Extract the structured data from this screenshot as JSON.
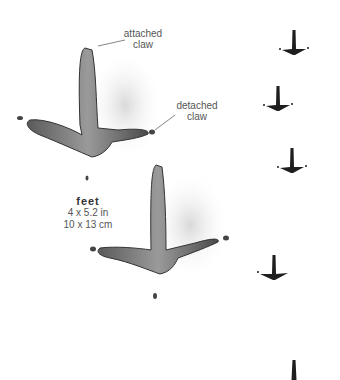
{
  "diagram": {
    "annotations": {
      "attached_claw": [
        "attached",
        "claw"
      ],
      "detached_claw": [
        "detached",
        "claw"
      ]
    },
    "size_label": {
      "title": "feet",
      "imperial": "4 x 5.2 in",
      "metric": "10 x 13 cm"
    },
    "large_prints": [
      {
        "x": 85,
        "y": 100,
        "label": "large-print-1"
      },
      {
        "x": 155,
        "y": 265,
        "label": "large-print-2"
      }
    ],
    "trackway_prints": [
      {
        "x": 294,
        "y": 52
      },
      {
        "x": 278,
        "y": 108
      },
      {
        "x": 292,
        "y": 170
      },
      {
        "x": 274,
        "y": 277
      },
      {
        "x": 294,
        "y": 380
      }
    ],
    "colors": {
      "ink": "#2a2a2a",
      "shade": "#777777",
      "text": "#555555"
    }
  }
}
